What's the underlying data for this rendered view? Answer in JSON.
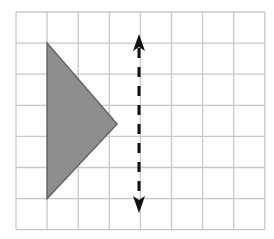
{
  "diagram": {
    "type": "grid-reflection",
    "description": "Triangle on a square grid with a vertical dashed double-headed arrow (line of reflection)",
    "grid": {
      "columns": 8,
      "rows": 7,
      "origin_px": [
        16,
        12
      ],
      "cell_px": 31.1,
      "line_color": "#c8c8c8"
    },
    "triangle": {
      "vertices_grid": [
        [
          1,
          1
        ],
        [
          1,
          6
        ],
        [
          3.25,
          3.6
        ]
      ],
      "fill": "#8e8e8e",
      "stroke": "#666666"
    },
    "dashed_arrow": {
      "x_px": 139,
      "y_top_px": 34,
      "y_bottom_px": 213,
      "color": "#111111",
      "double_headed": true
    }
  }
}
